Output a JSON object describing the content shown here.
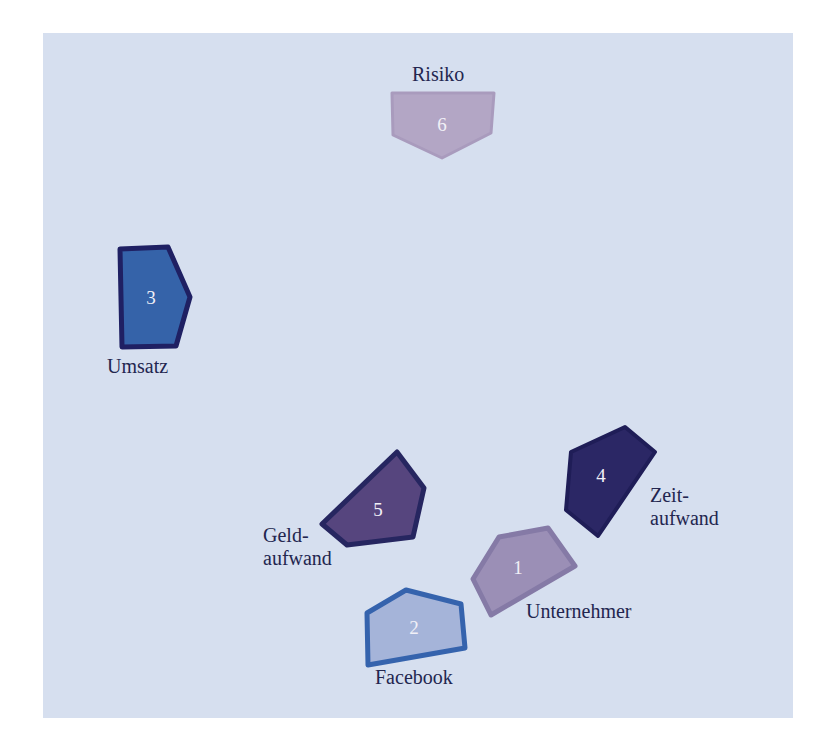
{
  "diagram": {
    "background": "#d6dfef",
    "text_color": "#23264f",
    "nodes": [
      {
        "number": "1",
        "label": "Unternehmer",
        "fill": "#9b8fb6",
        "stroke": "#857aa6"
      },
      {
        "number": "2",
        "label": "Facebook",
        "fill": "#a5b4d9",
        "stroke": "#3563ad"
      },
      {
        "number": "3",
        "label": "Umsatz",
        "fill": "#3563a9",
        "stroke": "#1f2063"
      },
      {
        "number": "4",
        "label": "Zeit-\naufwand",
        "fill": "#2b2765",
        "stroke": "#1f1d57"
      },
      {
        "number": "5",
        "label": "Geld-\naufwand",
        "fill": "#56457e",
        "stroke": "#262660"
      },
      {
        "number": "6",
        "label": "Risiko",
        "fill": "#b3a6c5",
        "stroke": "#a99bbd"
      }
    ]
  }
}
